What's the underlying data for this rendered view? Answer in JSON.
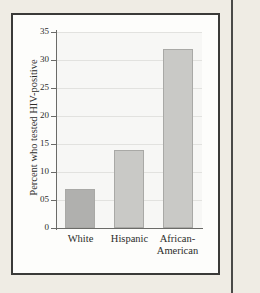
{
  "page": {
    "background_color": "#efece4",
    "card_background_color": "#fdfdfb",
    "card_border_color": "#3a3a38"
  },
  "chart_data": {
    "type": "bar",
    "title": "",
    "subtitle": "",
    "xlabel": "",
    "ylabel": "Percent who tested HIV-positive",
    "categories": [
      "White",
      "Hispanic",
      "African-American"
    ],
    "category_label_lines": [
      [
        "White"
      ],
      [
        "Hispanic"
      ],
      [
        "African-",
        "American"
      ]
    ],
    "values": [
      7,
      14,
      32
    ],
    "ylim": [
      0,
      35
    ],
    "ytick_values": [
      0,
      5,
      10,
      15,
      20,
      25,
      30,
      35
    ],
    "ytick_labels": [
      "0",
      "05",
      "10",
      "15",
      "20",
      "25",
      "30",
      "35"
    ],
    "grid": true,
    "legend": false,
    "bar_colors": [
      "#b0b0ae",
      "#c9c9c6",
      "#c9c9c6"
    ],
    "bar_border_color": "#a9a9a6",
    "plot_background_color": "#f7f7f5",
    "gridline_color": "#e2e2df",
    "axis_color": "#6b6b68"
  }
}
